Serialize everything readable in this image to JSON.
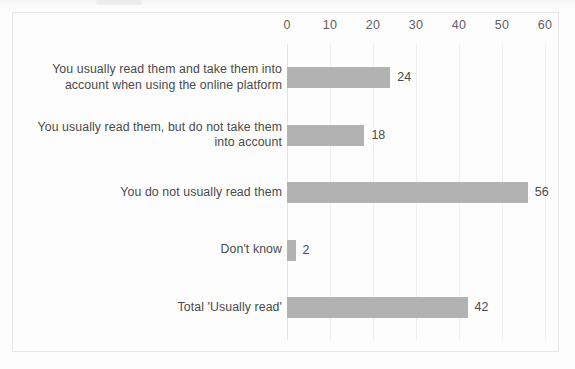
{
  "chart_data": {
    "type": "bar",
    "orientation": "horizontal",
    "title": "",
    "subtitle": "",
    "xlabel": "",
    "ylabel": "",
    "xlim": [
      0,
      60
    ],
    "grid": true,
    "legend": "none",
    "axis_ticks": [
      "0",
      "10",
      "20",
      "30",
      "40",
      "50",
      "60"
    ],
    "axis_tick_values": [
      0,
      10,
      20,
      30,
      40,
      50,
      60
    ],
    "categories": [
      "You usually read them and take them into account when using the online platform",
      "You usually read them, but do not take them into account",
      "You do not usually read them",
      "Don't know",
      "Total 'Usually read'"
    ],
    "values": [
      24,
      18,
      56,
      2,
      42
    ],
    "value_labels": [
      "24",
      "18",
      "56",
      "2",
      "42"
    ],
    "bar_color": "#b2b2b2",
    "label_color": "#4a4a4a",
    "gridline_color": "#f0f0f0",
    "frame_color": "#e6e6e6",
    "background_color": "#fdfdfd"
  }
}
